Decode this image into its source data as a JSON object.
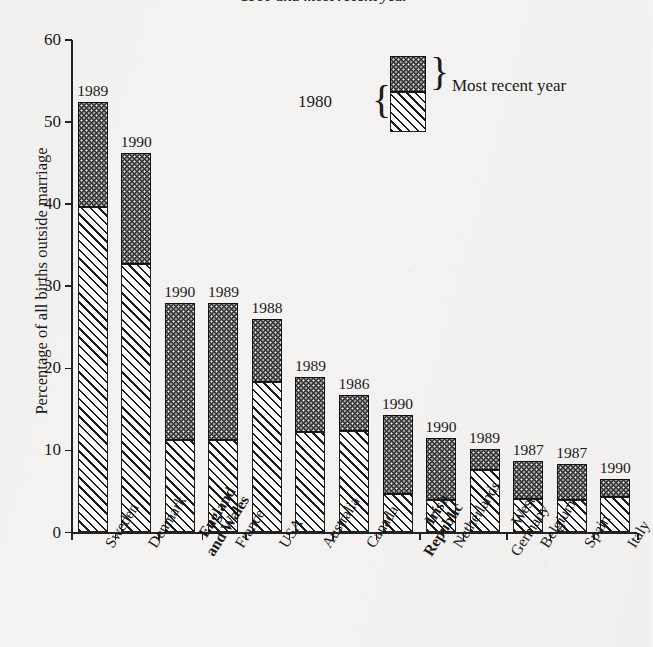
{
  "chart_data": {
    "type": "bar",
    "subtype": "stacked-two-period",
    "title": "1980 and most recent year",
    "xlabel": "",
    "ylabel": "Percentage of all births outside marriage",
    "ylim": [
      0,
      60
    ],
    "yticks": [
      0,
      10,
      20,
      30,
      40,
      50,
      60
    ],
    "grid": false,
    "legend": {
      "position": "top-right-inside",
      "lower_label": "1980",
      "upper_label": "Most recent year"
    },
    "categories": [
      "Sweden",
      "Denmark",
      "England and Wales",
      "France",
      "USA",
      "Australia",
      "Canada",
      "Irish Republic",
      "Netherlands",
      "West Germany",
      "Belgium",
      "Spain",
      "Italy"
    ],
    "category_lines": [
      [
        "Sweden"
      ],
      [
        "Denmark"
      ],
      [
        "England",
        "and Wales"
      ],
      [
        "France"
      ],
      [
        "USA"
      ],
      [
        "Australia"
      ],
      [
        "Canada"
      ],
      [
        "Irish",
        "Republic"
      ],
      [
        "Netherlands"
      ],
      [
        "West",
        "Germany"
      ],
      [
        "Belgium"
      ],
      [
        "Spain"
      ],
      [
        "Italy"
      ]
    ],
    "category_emphasis": [
      false,
      false,
      true,
      false,
      false,
      false,
      false,
      true,
      false,
      false,
      false,
      false,
      false
    ],
    "recent_year_labels": [
      "1989",
      "1990",
      "1990",
      "1989",
      "1988",
      "1989",
      "1986",
      "1990",
      "1990",
      "1989",
      "1987",
      "1987",
      "1990"
    ],
    "series": [
      {
        "name": "1980",
        "values": [
          39.6,
          32.7,
          11.3,
          11.3,
          18.3,
          12.3,
          12.4,
          4.7,
          4.0,
          7.6,
          4.1,
          3.9,
          4.3
        ]
      },
      {
        "name": "Most recent year",
        "values": [
          52.4,
          46.2,
          28.0,
          28.0,
          26.0,
          18.9,
          16.8,
          14.3,
          11.5,
          10.2,
          8.7,
          8.3,
          6.5
        ]
      }
    ]
  },
  "colors": {
    "ink": "#1d1d1d",
    "paper": "#f4f3f1",
    "recent_fill": "#2d2d2d",
    "old_fill": "#ffffff"
  }
}
